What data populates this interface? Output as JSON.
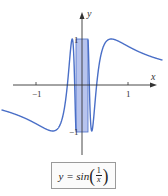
{
  "chart_data": {
    "type": "line",
    "title": "",
    "function": "y = sin(1/x)",
    "xlabel": "x",
    "ylabel": "y",
    "x_ticks": [
      {
        "value": -1,
        "label": "−1"
      },
      {
        "value": 1,
        "label": "1"
      }
    ],
    "y_ticks": [
      {
        "value": 1,
        "label": "1"
      },
      {
        "value": -1,
        "label": "−1"
      }
    ],
    "xlim": [
      -1.75,
      1.75
    ],
    "ylim": [
      -1.5,
      1.9
    ],
    "grid": false,
    "legend": "none",
    "series": [
      {
        "name": "sin(1/x)",
        "color": "#4a6fc7",
        "domain": [
          -1.75,
          1.75
        ]
      }
    ],
    "highlight_region": {
      "x": [
        -0.13,
        0.13
      ],
      "y": [
        -1,
        1
      ],
      "color": "#b7c4ee"
    }
  },
  "labels": {
    "x_axis": "x",
    "y_axis": "y",
    "tick_neg1_x": "−1",
    "tick_pos1_x": "1",
    "tick_pos1_y": "1",
    "tick_neg1_y": "−1"
  },
  "formula": {
    "lhs": "y = sin",
    "numerator": "1",
    "denominator": "x"
  },
  "colors": {
    "curve": "#4a6fc7",
    "highlight": "#b7c4ee",
    "axis": "#333333"
  }
}
